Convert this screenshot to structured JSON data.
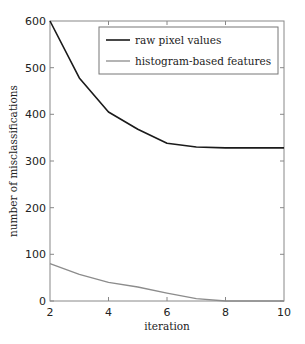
{
  "chart_data": {
    "type": "line",
    "title": "",
    "xlabel": "iteration",
    "ylabel": "number of misclassifications",
    "xlim": [
      2,
      10
    ],
    "ylim": [
      0,
      600
    ],
    "xticks": [
      2,
      4,
      6,
      8,
      10
    ],
    "yticks": [
      0,
      100,
      200,
      300,
      400,
      500,
      600
    ],
    "grid": false,
    "legend_position": "upper right",
    "x": [
      2,
      3,
      4,
      5,
      6,
      7,
      8,
      9,
      10
    ],
    "series": [
      {
        "name": "raw pixel values",
        "color": "#1a1a1a",
        "values": [
          600,
          478,
          405,
          368,
          338,
          330,
          328,
          328,
          328
        ]
      },
      {
        "name": "histogram-based features",
        "color": "#8c8c8c",
        "values": [
          80,
          57,
          40,
          30,
          17,
          5,
          0,
          0,
          0
        ]
      }
    ]
  },
  "labels": {
    "xlabel": "iteration",
    "ylabel": "number of misclassifications",
    "legend": [
      "raw pixel values",
      "histogram-based features"
    ],
    "xticks": [
      "2",
      "4",
      "6",
      "8",
      "10"
    ],
    "yticks": [
      "0",
      "100",
      "200",
      "300",
      "400",
      "500",
      "600"
    ]
  }
}
